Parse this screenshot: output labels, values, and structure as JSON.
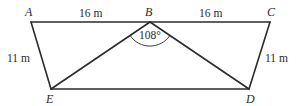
{
  "diagram": {
    "type": "geometry-figure",
    "vertices": [
      {
        "id": "A",
        "label": "A",
        "x": 31,
        "y": 22
      },
      {
        "id": "B",
        "label": "B",
        "x": 150,
        "y": 22
      },
      {
        "id": "C",
        "label": "C",
        "x": 270,
        "y": 22
      },
      {
        "id": "D",
        "label": "D",
        "x": 249,
        "y": 89
      },
      {
        "id": "E",
        "label": "E",
        "x": 51,
        "y": 89
      }
    ],
    "edges": [
      {
        "from": "A",
        "to": "B"
      },
      {
        "from": "B",
        "to": "C"
      },
      {
        "from": "C",
        "to": "D"
      },
      {
        "from": "D",
        "to": "E"
      },
      {
        "from": "E",
        "to": "A"
      },
      {
        "from": "B",
        "to": "E"
      },
      {
        "from": "B",
        "to": "D"
      }
    ],
    "measurements": {
      "AB": "16 m",
      "BC": "16 m",
      "AE": "11 m",
      "CD": "11 m",
      "angle_EBD": "108°"
    }
  }
}
